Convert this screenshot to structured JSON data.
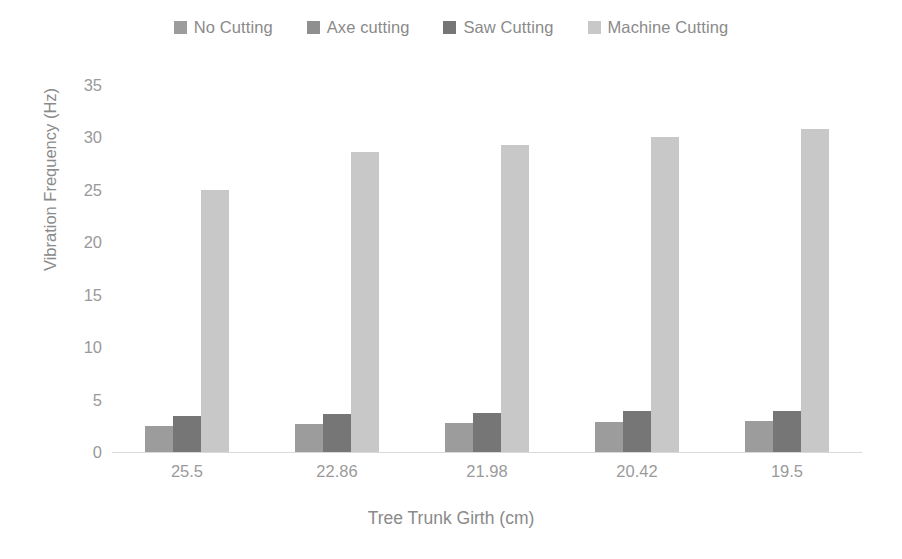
{
  "chart_data": {
    "type": "bar",
    "title": "",
    "subtitle": "",
    "xlabel": "Tree Trunk Girth (cm)",
    "ylabel": "Vibration Frequency (Hz)",
    "categories": [
      "25.5",
      "22.86",
      "21.98",
      "20.42",
      "19.5"
    ],
    "series": [
      {
        "name": "No Cutting",
        "color": "#9c9c9c",
        "values": [
          2.5,
          2.7,
          2.8,
          2.9,
          3.0
        ]
      },
      {
        "name": "Axe cutting",
        "color": "#8f8f8f",
        "values": [
          0,
          0,
          0,
          0,
          0
        ]
      },
      {
        "name": "Saw Cutting",
        "color": "#767676",
        "values": [
          3.4,
          3.6,
          3.7,
          3.9,
          3.9
        ]
      },
      {
        "name": "Machine Cutting",
        "color": "#c8c8c8",
        "values": [
          25.0,
          28.6,
          29.3,
          30.0,
          30.8
        ]
      }
    ],
    "ylim": [
      0,
      35
    ],
    "ytick_step": 5,
    "yticks": [
      "35",
      "30",
      "25",
      "20",
      "15",
      "10",
      "5",
      "0"
    ],
    "grid": false,
    "legend_position": "top",
    "axis_color": "#d9d9d9",
    "text_color": "#8a8a8a"
  },
  "legend": {
    "items": [
      {
        "label": "No Cutting"
      },
      {
        "label": "Axe cutting"
      },
      {
        "label": "Saw Cutting"
      },
      {
        "label": "Machine Cutting"
      }
    ]
  }
}
